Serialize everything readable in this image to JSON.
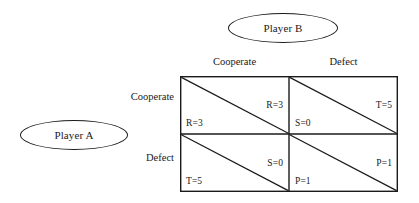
{
  "figure": {
    "type": "payoff-matrix",
    "line_color": "#1a1a1a",
    "background_color": "#ffffff"
  },
  "players": {
    "row": {
      "name": "Player A"
    },
    "column": {
      "name": "Player B"
    }
  },
  "strategies": {
    "columns": [
      {
        "key": "cooperate",
        "label": "Cooperate"
      },
      {
        "key": "defect",
        "label": "Defect"
      }
    ],
    "rows": [
      {
        "key": "cooperate",
        "label": "Cooperate"
      },
      {
        "key": "defect",
        "label": "Defect"
      }
    ]
  },
  "cells": {
    "cc": {
      "row_strategy": "Cooperate",
      "col_strategy": "Cooperate",
      "column_payoff": "R=3",
      "row_payoff": "R=3"
    },
    "cd": {
      "row_strategy": "Cooperate",
      "col_strategy": "Defect",
      "column_payoff": "T=5",
      "row_payoff": "S=0"
    },
    "dc": {
      "row_strategy": "Defect",
      "col_strategy": "Cooperate",
      "column_payoff": "S=0",
      "row_payoff": "T=5"
    },
    "dd": {
      "row_strategy": "Defect",
      "col_strategy": "Defect",
      "column_payoff": "P=1",
      "row_payoff": "P=1"
    }
  }
}
